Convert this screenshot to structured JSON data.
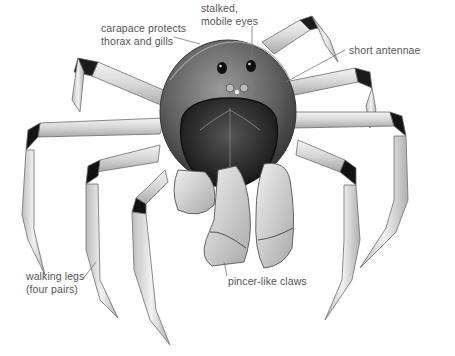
{
  "diagram": {
    "labels": [
      {
        "id": "eyes",
        "text": "stalked,\nmobile eyes"
      },
      {
        "id": "carapace",
        "text": "carapace protects\nthorax and gills"
      },
      {
        "id": "antennae",
        "text": "short antennae"
      },
      {
        "id": "legs",
        "text": "walking legs\n(four pairs)"
      },
      {
        "id": "claws",
        "text": "pincer-like claws"
      }
    ],
    "colors": {
      "background": "#ffffff",
      "label_text": "#555555",
      "leader_line": "#777777",
      "shell_dark": "#1f1f1f",
      "shell_mid": "#6a6a6a",
      "leg_light": "#e6e6e6",
      "joint_dark": "#141414"
    }
  }
}
